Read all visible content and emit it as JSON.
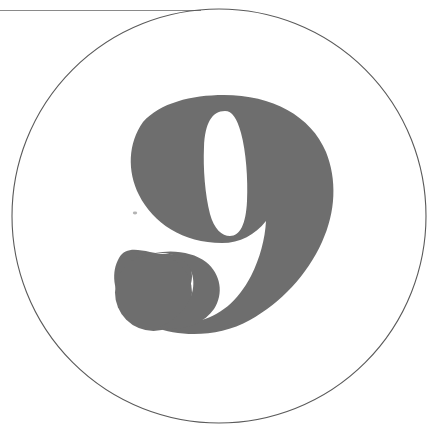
{
  "page": {
    "title": "Numeral Nine Plate",
    "width": 432,
    "height": 438,
    "background_color": "#ffffff"
  },
  "artwork": {
    "name": "numeral-nine-in-circle",
    "type": "scanned-print-specimen",
    "description": "A large grey numeral 9 centred inside a thin circular rule, with a thin horizontal rule crossing the upper left of the frame.",
    "primary_glyph": "9",
    "glyph_style": "bold didone serif numeral with ball terminal tail",
    "colors": {
      "glyph_fill": "#6e6e6e",
      "circle_stroke": "#5a5a5a",
      "rule_stroke": "#8a8a8a",
      "paper": "#ffffff"
    }
  },
  "geometry": {
    "circle": {
      "center_x": 219,
      "center_y": 216,
      "radius": 207,
      "stroke_width": 1.1
    },
    "horizontal_rule": {
      "x1": 0,
      "y1": 10,
      "x2": 201,
      "y2": 10,
      "stroke_width": 1.1
    },
    "glyph_bounds": {
      "left": 108,
      "top": 95,
      "right": 332,
      "bottom": 334,
      "width": 224,
      "height": 239
    },
    "counter_bounds": {
      "left": 204,
      "top": 110,
      "right": 246,
      "bottom": 236
    },
    "tail_lobe_bounds": {
      "left": 115,
      "top": 254,
      "right": 192,
      "bottom": 331
    }
  },
  "labels": {
    "glyph_alt": "Numeral nine",
    "circle_alt": "Thin circular outline",
    "rule_alt": "Thin horizontal rule"
  }
}
